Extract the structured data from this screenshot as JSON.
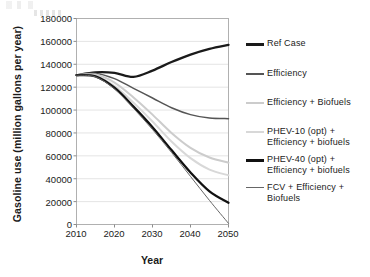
{
  "chart_data": {
    "type": "line",
    "title": "",
    "xlabel": "Year",
    "ylabel": "Gasoline use (million gallons per year)",
    "xlim": [
      2010,
      2050
    ],
    "ylim": [
      0,
      180000
    ],
    "xticks": [
      "2010",
      "2020",
      "2030",
      "2040",
      "2050"
    ],
    "yticks": [
      "0",
      "20000",
      "40000",
      "60000",
      "80000",
      "100000",
      "120000",
      "140000",
      "160000",
      "180000"
    ],
    "grid": "horizontal",
    "legend_position": "right",
    "x": [
      2010,
      2015,
      2020,
      2025,
      2030,
      2035,
      2040,
      2045,
      2050
    ],
    "series": [
      {
        "name": "Ref Case",
        "color": "#1a1a1a",
        "width": 2.3,
        "values": [
          130500,
          133000,
          132500,
          129000,
          134500,
          142000,
          148500,
          153500,
          157000
        ]
      },
      {
        "name": "Efficiency",
        "color": "#555555",
        "width": 1.5,
        "values": [
          130500,
          132000,
          127500,
          119000,
          110500,
          102000,
          96000,
          93000,
          92500
        ]
      },
      {
        "name": "Efficiency + Biofuels",
        "color": "#cccccc",
        "width": 2.0,
        "values": [
          130500,
          131000,
          124000,
          111000,
          96000,
          80000,
          67000,
          58500,
          54000
        ]
      },
      {
        "name": "PHEV-10 (opt) +\nEfficiency + biofuels",
        "color": "#d8d8d8",
        "width": 2.0,
        "values": [
          130500,
          130000,
          121000,
          106500,
          90000,
          72500,
          58000,
          48000,
          43000
        ]
      },
      {
        "name": "PHEV-40 (opt) +\nEfficiency + biofuels",
        "color": "#111111",
        "width": 2.3,
        "values": [
          130500,
          129500,
          119500,
          103000,
          85000,
          65000,
          45500,
          29000,
          19000
        ]
      },
      {
        "name": "FCV + Efficiency +\nBiofuels",
        "color": "#666666",
        "width": 1.0,
        "values": [
          130500,
          129000,
          118500,
          101500,
          83000,
          63000,
          42000,
          21000,
          1000
        ]
      }
    ]
  },
  "legend": {
    "items": [
      {
        "label": "Ref Case"
      },
      {
        "label": "Efficiency"
      },
      {
        "label": "Efficiency + Biofuels"
      },
      {
        "label": "PHEV-10 (opt) +\nEfficiency + biofuels"
      },
      {
        "label": "PHEV-40 (opt) +\nEfficiency + biofuels"
      },
      {
        "label": "FCV + Efficiency +\nBiofuels"
      }
    ]
  },
  "plot": {
    "frame_color": "#b0b0b0",
    "grid_color": "#e4e4e4",
    "background": "#ffffff"
  }
}
